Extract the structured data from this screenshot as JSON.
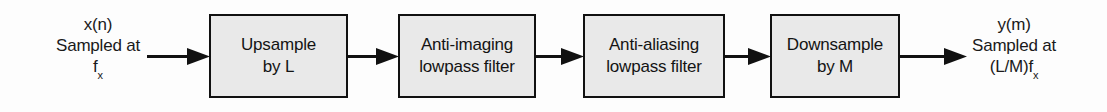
{
  "diagram": {
    "line_color": "#111111",
    "block_fill": "#e9e9e9",
    "background": "#fdfdfd",
    "input_label": {
      "line1": "x(n)",
      "line2": "Sampled at",
      "line3_base": "f",
      "line3_sub": "x"
    },
    "output_label": {
      "line1": "y(m)",
      "line2": "Sampled at",
      "line3_base": "(L/M)f",
      "line3_sub": "x"
    },
    "blocks": [
      {
        "id": "upsample",
        "line1": "Upsample",
        "line2": "by L"
      },
      {
        "id": "antiimage",
        "line1": "Anti-imaging",
        "line2": "lowpass filter"
      },
      {
        "id": "antialias",
        "line1": "Anti-aliasing",
        "line2": "lowpass filter"
      },
      {
        "id": "downsample",
        "line1": "Downsample",
        "line2": "by M"
      }
    ],
    "arrows": [
      {
        "id": "arrow-in",
        "from": "input-label",
        "to": "upsample"
      },
      {
        "id": "arrow-1-2",
        "from": "upsample",
        "to": "antiimage"
      },
      {
        "id": "arrow-2-3",
        "from": "antiimage",
        "to": "antialias"
      },
      {
        "id": "arrow-3-4",
        "from": "antialias",
        "to": "downsample"
      },
      {
        "id": "arrow-out",
        "from": "downsample",
        "to": "output-label"
      }
    ]
  }
}
